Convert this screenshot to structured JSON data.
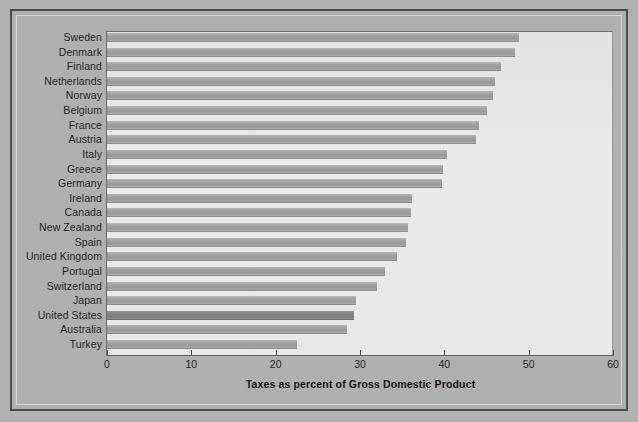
{
  "chart_data": {
    "type": "bar",
    "orientation": "horizontal",
    "title": "",
    "xlabel": "Taxes as percent of Gross Domestic Product",
    "ylabel": "",
    "xlim": [
      0,
      60
    ],
    "xticks": [
      0,
      10,
      20,
      30,
      40,
      50,
      60
    ],
    "xtick_labels": [
      "0",
      "10",
      "20",
      "30",
      "40",
      "50",
      "60"
    ],
    "grid": false,
    "legend": null,
    "highlight_category": "United States",
    "categories": [
      "Sweden",
      "Denmark",
      "Finland",
      "Netherlands",
      "Norway",
      "Belgium",
      "France",
      "Austria",
      "Italy",
      "Greece",
      "Germany",
      "Ireland",
      "Canada",
      "New Zealand",
      "Spain",
      "United Kingdom",
      "Portugal",
      "Switzerland",
      "Japan",
      "United States",
      "Australia",
      "Turkey"
    ],
    "values": [
      48.8,
      48.4,
      46.7,
      46.0,
      45.8,
      45.0,
      44.1,
      43.8,
      40.3,
      39.9,
      39.7,
      36.2,
      36.1,
      35.7,
      35.5,
      34.4,
      33.0,
      32.0,
      29.5,
      29.3,
      28.5,
      22.5
    ]
  },
  "colors": {
    "page_background": "#b4b4b4",
    "frame_border": "#4a4a4a",
    "plot_background": "#ebebeb",
    "bar_fill": "#a6a6a6",
    "bar_highlight_fill": "#8a8a8a",
    "text": "#1d1d1d"
  }
}
